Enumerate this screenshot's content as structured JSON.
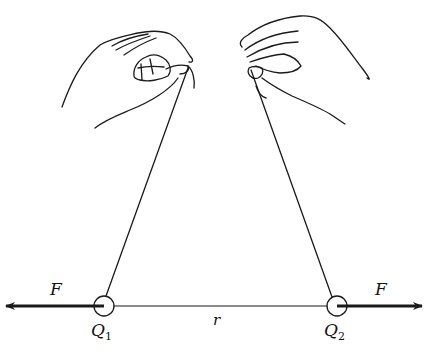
{
  "diagram": {
    "labels": {
      "force_left": "F",
      "force_right": "F",
      "charge1": "Q",
      "charge1_sub": "1",
      "charge2": "Q",
      "charge2_sub": "2",
      "distance": "r"
    },
    "colors": {
      "ink": "#1a1a1a",
      "background": "#ffffff"
    }
  }
}
